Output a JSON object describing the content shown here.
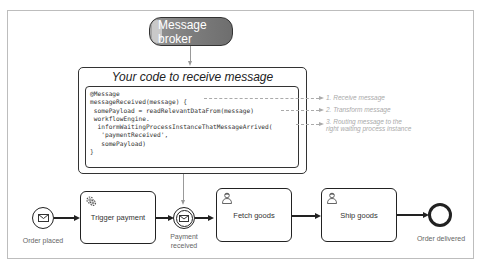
{
  "broker": {
    "label": "Message broker"
  },
  "code_block": {
    "title": "Your code to receive message",
    "lines": [
      "@Message",
      "messageReceived(message) {",
      " somePayload = readRelevantDataFrom(message)",
      " workflowEngine.",
      "  informWaitingProcessInstanceThatMessageArrived(",
      "   'paymentReceived',",
      "   somePayload)",
      "}"
    ]
  },
  "annotations": [
    {
      "text": "1. Receive message"
    },
    {
      "text": "2. Transform message"
    },
    {
      "text_line1": "3. Routing message to the",
      "text_line2": "right waiting process instance"
    }
  ],
  "process": {
    "start_event": {
      "label": "Order placed",
      "icon": "envelope-icon"
    },
    "task_trigger_payment": {
      "label": "Trigger payment",
      "icon": "gear-icon"
    },
    "intermediate_event": {
      "label_line1": "Payment",
      "label_line2": "received",
      "icon": "envelope-icon"
    },
    "task_fetch_goods": {
      "label": "Fetch goods",
      "icon": "user-icon"
    },
    "task_ship_goods": {
      "label": "Ship goods",
      "icon": "user-icon"
    },
    "end_event": {
      "label": "Order delivered"
    }
  }
}
